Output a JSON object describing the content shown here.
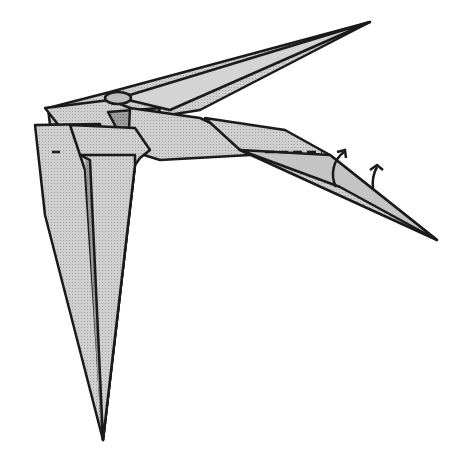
{
  "diagram": {
    "type": "origami-folding-step",
    "colors": {
      "background": "#ffffff",
      "paper_light": "#c8c8c8",
      "paper_mid": "#a8a8a8",
      "paper_dark": "#888888",
      "outline": "#1a1a1a"
    },
    "annotations": [
      {
        "kind": "valley-fold-line",
        "name": "dashed-fold-line"
      },
      {
        "kind": "arrow",
        "name": "fold-up-arrow-1",
        "direction": "up"
      },
      {
        "kind": "arrow",
        "name": "fold-up-arrow-2",
        "direction": "up"
      },
      {
        "kind": "valley-fold-line",
        "name": "small-dash-left"
      }
    ]
  }
}
